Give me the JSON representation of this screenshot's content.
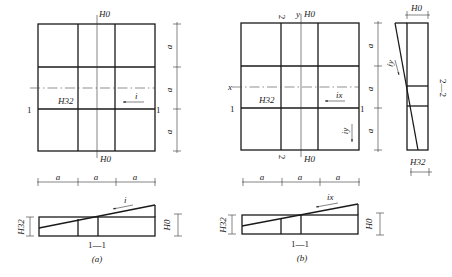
{
  "figure": {
    "panels": [
      {
        "id": "a",
        "caption": "(a)",
        "plan": {
          "top_label": "H0",
          "bottom_label": "H0",
          "corner_label": "H32",
          "slope_label": "i",
          "section_mark_left": "1",
          "section_mark_right": "1",
          "dim_labels_right": [
            "a",
            "a",
            "a"
          ],
          "dim_labels_bottom": [
            "a",
            "a",
            "a"
          ]
        },
        "section": {
          "title": "1—1",
          "left_height_label": "H32",
          "right_height_label": "H0",
          "slope_label": "i"
        }
      },
      {
        "id": "b",
        "caption": "(b)",
        "plan": {
          "top_axis_label": "y",
          "top_label": "H0",
          "bottom_label": "H0",
          "x_axis_label": "x",
          "corner_label": "H32",
          "slope_x_label": "ix",
          "slope_y_label": "iy",
          "section_mark_left": "1",
          "section_mark_right": "1",
          "section_mark_top": "2",
          "section_mark_bottom": "2",
          "dim_labels_right": [
            "a",
            "a",
            "a"
          ],
          "dim_labels_bottom": [
            "a",
            "a",
            "a"
          ]
        },
        "section_1_1": {
          "title": "1—1",
          "left_height_label": "H32",
          "right_height_label": "H0",
          "slope_label": "ix"
        },
        "section_2_2": {
          "title": "2—2",
          "top_width_label": "H0",
          "bottom_width_label": "H32",
          "slope_label": "iy"
        }
      }
    ]
  }
}
